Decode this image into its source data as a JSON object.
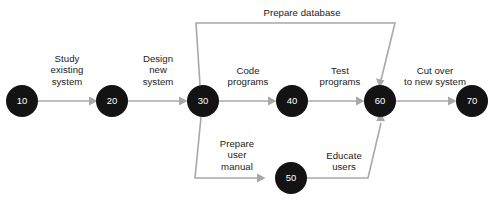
{
  "diagram": {
    "type": "pert-network-diagram",
    "title": "",
    "canvas": {
      "width": 494,
      "height": 201
    },
    "colors": {
      "background": "#ffffff",
      "node_fill": "#131313",
      "node_text": "#ffffff",
      "edge_stroke": "#a8a8a8",
      "label_text": "#1b1b1b"
    },
    "nodes": [
      {
        "id": "10",
        "label": "10",
        "cx": 22,
        "cy": 101,
        "r": 16
      },
      {
        "id": "20",
        "label": "20",
        "cx": 112,
        "cy": 101,
        "r": 16
      },
      {
        "id": "30",
        "label": "30",
        "cx": 203,
        "cy": 101,
        "r": 16
      },
      {
        "id": "40",
        "label": "40",
        "cx": 292,
        "cy": 101,
        "r": 16
      },
      {
        "id": "50",
        "label": "50",
        "cx": 291,
        "cy": 178,
        "r": 16
      },
      {
        "id": "60",
        "label": "60",
        "cx": 380,
        "cy": 101,
        "r": 16
      },
      {
        "id": "70",
        "label": "70",
        "cx": 472,
        "cy": 101,
        "r": 16
      }
    ],
    "edges": [
      {
        "from": "10",
        "to": "20",
        "label": "Study\nexisting\nsystem",
        "label_x": 67,
        "label_y": 53
      },
      {
        "from": "20",
        "to": "30",
        "label": "Design\nnew\nsystem",
        "label_x": 158,
        "label_y": 53
      },
      {
        "from": "30",
        "to": "40",
        "label": "Code\nprograms",
        "label_x": 248,
        "label_y": 65
      },
      {
        "from": "40",
        "to": "60",
        "label": "Test\nprograms",
        "label_x": 340,
        "label_y": 65
      },
      {
        "from": "60",
        "to": "70",
        "label": "Cut over\nto new system",
        "label_x": 435,
        "label_y": 65
      },
      {
        "from": "30",
        "to": "60",
        "label": "Prepare database",
        "label_x": 302,
        "label_y": 7,
        "route": "top"
      },
      {
        "from": "30",
        "to": "50",
        "label": "Prepare\nuser\nmanual",
        "label_x": 237,
        "label_y": 138,
        "route": "bottom"
      },
      {
        "from": "50",
        "to": "60",
        "label": "Educate\nusers",
        "label_x": 344,
        "label_y": 150,
        "route": "bottom"
      }
    ]
  }
}
